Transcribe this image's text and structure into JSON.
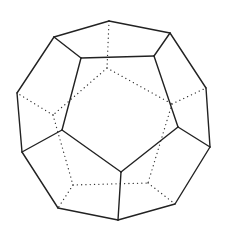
{
  "diagram": {
    "colors": {
      "background": "#ffffff",
      "visible_edge": "#222222",
      "hidden_edge": "#333333"
    },
    "vertices": {
      "T": [
        109,
        21
      ],
      "LT": [
        54,
        37
      ],
      "RT": [
        170,
        33
      ],
      "IT1": [
        81,
        58
      ],
      "IT2": [
        154,
        56
      ],
      "L": [
        17,
        93
      ],
      "R": [
        206,
        88
      ],
      "IL": [
        62,
        130
      ],
      "IR": [
        178,
        127
      ],
      "LL": [
        22,
        152
      ],
      "LR": [
        210,
        147
      ],
      "IB": [
        121,
        172
      ],
      "BL": [
        58,
        208
      ],
      "BR": [
        175,
        204
      ],
      "B": [
        118,
        220
      ],
      "HT": [
        107,
        68
      ],
      "HL": [
        53,
        115
      ],
      "HR": [
        172,
        104
      ],
      "HBL": [
        73,
        185
      ],
      "HBR": [
        148,
        183
      ],
      "HLT": [
        22,
        97
      ],
      "HRT": [
        200,
        92
      ],
      "HBLo": [
        62,
        203
      ],
      "HBRo": [
        172,
        202
      ]
    },
    "visible_edges": [
      [
        "T",
        "LT"
      ],
      [
        "T",
        "RT"
      ],
      [
        "LT",
        "IT1"
      ],
      [
        "RT",
        "IT2"
      ],
      [
        "IT1",
        "IT2"
      ],
      [
        "LT",
        "L"
      ],
      [
        "RT",
        "R"
      ],
      [
        "IT1",
        "IL"
      ],
      [
        "IT2",
        "IR"
      ],
      [
        "L",
        "LL"
      ],
      [
        "R",
        "LR"
      ],
      [
        "IL",
        "LL"
      ],
      [
        "IR",
        "LR"
      ],
      [
        "IL",
        "IB"
      ],
      [
        "IR",
        "IB"
      ],
      [
        "IB",
        "B"
      ],
      [
        "LL",
        "BL"
      ],
      [
        "LR",
        "BR"
      ],
      [
        "BL",
        "B"
      ],
      [
        "BR",
        "B"
      ]
    ],
    "hidden_edges": [
      [
        "T",
        "HT"
      ],
      [
        "HT",
        "HL"
      ],
      [
        "HT",
        "HR"
      ],
      [
        "HL",
        "L"
      ],
      [
        "HR",
        "R"
      ],
      [
        "HL",
        "HBL"
      ],
      [
        "HR",
        "HBR"
      ],
      [
        "HBL",
        "HBR"
      ],
      [
        "HBL",
        "BL"
      ],
      [
        "HBR",
        "BR"
      ]
    ]
  }
}
